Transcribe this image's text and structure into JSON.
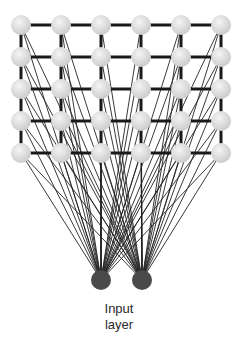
{
  "diagram": {
    "type": "neural-network",
    "grid": {
      "columns_x": [
        21,
        61,
        101,
        141,
        181,
        221
      ],
      "rows_y": [
        25,
        57,
        89,
        121,
        153
      ],
      "node_radius": 10,
      "node_color_light": "#efefef",
      "node_color_dark": "#c8c8c8",
      "edge_color": "#1a1a1a"
    },
    "input_nodes": [
      {
        "x": 101,
        "y": 280
      },
      {
        "x": 142,
        "y": 280
      }
    ],
    "input_node_radius": 10,
    "input_node_color": "#4a4a4a",
    "connection_color": "#222222",
    "label_line1": "Input",
    "label_line2": "layer"
  }
}
